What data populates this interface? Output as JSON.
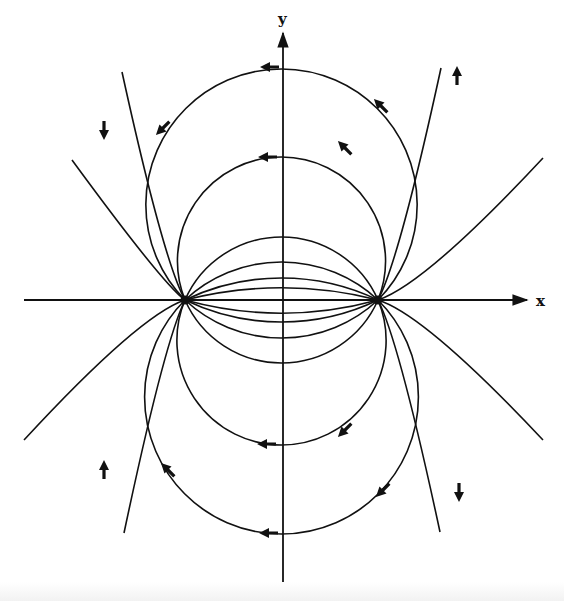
{
  "diagram": {
    "axes": {
      "x_label": "x",
      "y_label": "y",
      "x_axis": {
        "y": 300,
        "x_start": 24,
        "x_end": 527
      },
      "y_axis": {
        "x": 283,
        "y_start": 588,
        "y_end": 33
      },
      "x_label_pos": [
        536,
        294
      ],
      "y_label_pos": [
        278,
        12
      ]
    },
    "charges": [
      {
        "name": "left-charge",
        "x": 185,
        "y": 300
      },
      {
        "name": "right-charge",
        "x": 378,
        "y": 300
      }
    ],
    "field_lines": {
      "description": "Circular arcs through both charges; arrows point from right charge toward left charge",
      "inner_crossings_above": [
        69,
        157,
        237,
        262,
        278,
        288
      ],
      "inner_crossings_below": [
        313,
        322,
        338,
        363,
        445,
        534
      ],
      "outer_lines": [
        {
          "side": "upper",
          "left_end": [
            72,
            160
          ],
          "right_end": [
            543,
            158
          ]
        },
        {
          "side": "upper",
          "left_end": [
            122,
            72
          ],
          "right_end": [
            441,
            68
          ]
        },
        {
          "side": "lower",
          "left_end": [
            24,
            440
          ],
          "right_end": [
            543,
            440
          ]
        },
        {
          "side": "lower",
          "left_end": [
            124,
            533
          ],
          "right_end": [
            440,
            532
          ]
        }
      ]
    },
    "arrows": [
      {
        "x": 270,
        "y": 67,
        "dir": "left"
      },
      {
        "x": 268,
        "y": 157,
        "dir": "left"
      },
      {
        "x": 163,
        "y": 128,
        "dir": "down-left"
      },
      {
        "x": 104,
        "y": 130,
        "dir": "down"
      },
      {
        "x": 345,
        "y": 148,
        "dir": "up-left"
      },
      {
        "x": 381,
        "y": 106,
        "dir": "up-left"
      },
      {
        "x": 457,
        "y": 76,
        "dir": "up"
      },
      {
        "x": 267,
        "y": 444,
        "dir": "left"
      },
      {
        "x": 269,
        "y": 533,
        "dir": "left"
      },
      {
        "x": 345,
        "y": 430,
        "dir": "down-left"
      },
      {
        "x": 383,
        "y": 490,
        "dir": "down-left"
      },
      {
        "x": 459,
        "y": 492,
        "dir": "down"
      },
      {
        "x": 104,
        "y": 470,
        "dir": "up"
      },
      {
        "x": 168,
        "y": 470,
        "dir": "up-left"
      }
    ],
    "colors": {
      "line": "#111111",
      "background": "#ffffff"
    }
  }
}
